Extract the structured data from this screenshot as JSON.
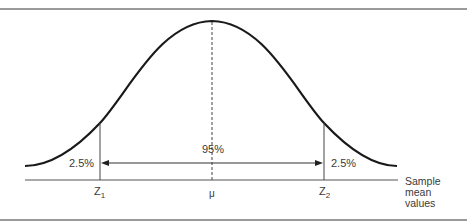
{
  "diagram": {
    "type": "normal-distribution",
    "center_label": "95%",
    "left_tail_label": "2.5%",
    "right_tail_label": "2.5%",
    "x_markers": {
      "left": {
        "main": "Z",
        "sub": "1"
      },
      "center": "μ",
      "right": {
        "main": "Z",
        "sub": "2"
      }
    },
    "axis_label": [
      "Sample",
      "mean",
      "values"
    ],
    "colors": {
      "curve": "#1a1a1a",
      "lines": "#333333",
      "text": "#3a3a3a",
      "frame": "#9a9a9a"
    }
  }
}
